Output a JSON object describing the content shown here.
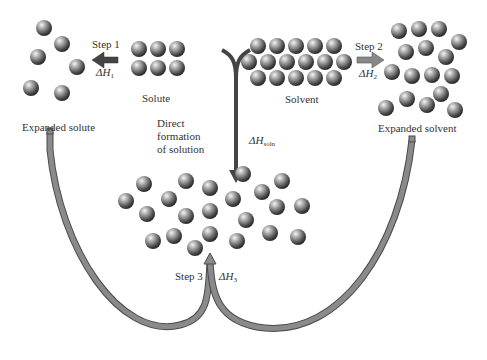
{
  "labels": {
    "step1": "Step 1",
    "dh1_sub": "1",
    "step2": "Step 2",
    "dh2_sub": "2",
    "step3": "Step 3",
    "dh3_sub": "3",
    "dh_symbol": "ΔH",
    "dhsoln_sub": "soln",
    "solute": "Solute",
    "solvent": "Solvent",
    "expanded_solute": "Expanded solute",
    "expanded_solvent": "Expanded solvent",
    "direct_line1": "Direct",
    "direct_line2": "formation",
    "direct_line3": "of solution"
  },
  "colors": {
    "sphere_light": "#e8e8e8",
    "sphere_mid": "#8a8a8a",
    "sphere_dark": "#3a3a3a",
    "arrow_fill": "#7a7a7a",
    "arrow_outline": "#4a4a4a",
    "center_arrow": "#444444"
  }
}
